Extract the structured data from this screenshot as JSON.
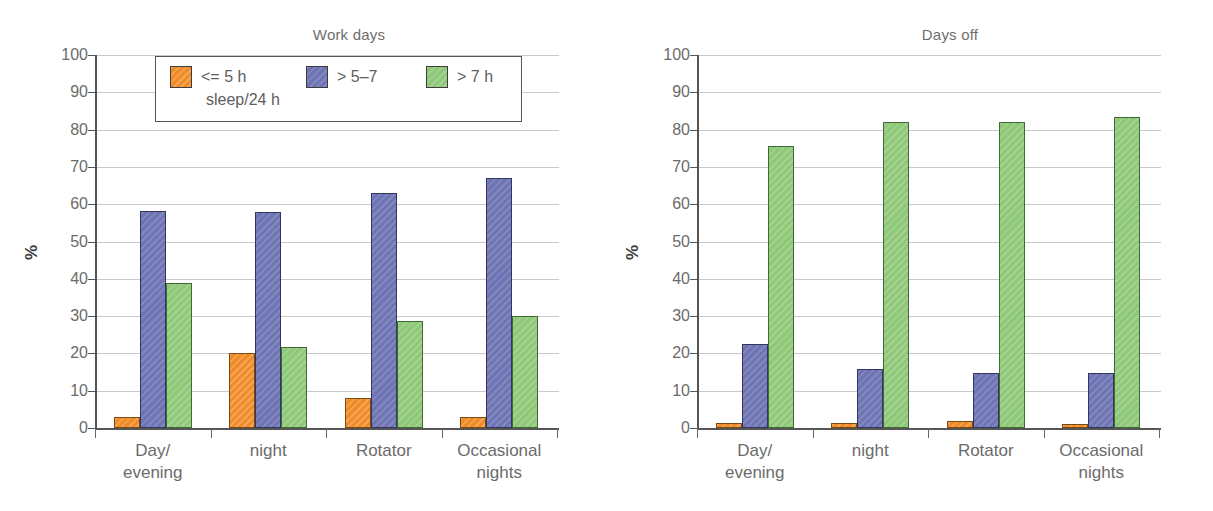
{
  "figure": {
    "panels": [
      {
        "key": "work_days",
        "title": "Work days",
        "ylabel": "%"
      },
      {
        "key": "days_off",
        "title": "Days off",
        "ylabel": "%"
      }
    ],
    "legend": {
      "items": [
        {
          "label": "<= 5 h",
          "color": "#f18b28",
          "swatch_name": "legend-swatch-le5h"
        },
        {
          "label": "> 5–7",
          "color": "#6e74b4",
          "swatch_name": "legend-swatch-5to7h"
        },
        {
          "label": "> 7 h",
          "color": "#8ec878",
          "swatch_name": "legend-swatch-gt7h"
        }
      ],
      "subtitle": "sleep/24 h"
    },
    "yticks": [
      "0",
      "10",
      "20",
      "30",
      "40",
      "50",
      "60",
      "70",
      "80",
      "90",
      "100"
    ],
    "colors": {
      "series_le5h": "#f18b28",
      "series_5to7h": "#6e74b4",
      "series_gt7h": "#8ec878",
      "axis": "#555555",
      "grid": "#c9c9c9",
      "text": "#6b6b6b"
    }
  },
  "chart_data": [
    {
      "type": "bar",
      "title": "Work days",
      "xlabel": "",
      "ylabel": "%",
      "ylim": [
        0,
        100
      ],
      "ytick_step": 10,
      "grid": true,
      "legend_position": "top-left-inside",
      "categories": [
        "Day/\nevening",
        "night",
        "Rotator",
        "Occasional\nnights"
      ],
      "series": [
        {
          "name": "<= 5 h",
          "values": [
            3,
            20,
            8,
            3
          ]
        },
        {
          "name": "> 5–7",
          "values": [
            58.3,
            58,
            63,
            67
          ]
        },
        {
          "name": "> 7 h",
          "values": [
            39,
            21.7,
            28.8,
            30
          ]
        }
      ]
    },
    {
      "type": "bar",
      "title": "Days off",
      "xlabel": "",
      "ylabel": "%",
      "ylim": [
        0,
        100
      ],
      "ytick_step": 10,
      "grid": true,
      "legend_position": "none",
      "categories": [
        "Day/\nevening",
        "night",
        "Rotator",
        "Occasional\nnights"
      ],
      "series": [
        {
          "name": "<= 5 h",
          "values": [
            1.3,
            1.3,
            2.0,
            1.2
          ]
        },
        {
          "name": "> 5–7",
          "values": [
            22.5,
            15.8,
            14.7,
            14.7
          ]
        },
        {
          "name": "> 7 h",
          "values": [
            75.5,
            82,
            82,
            83.5
          ]
        }
      ]
    }
  ]
}
